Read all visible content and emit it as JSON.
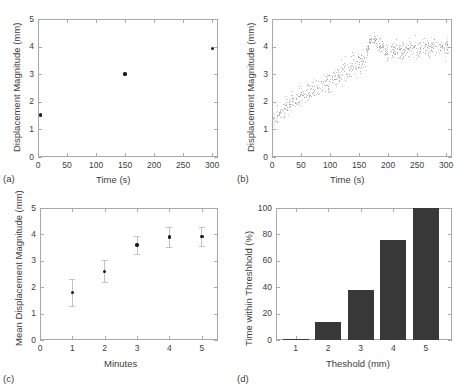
{
  "figure": {
    "width": 465,
    "height": 388,
    "background": "#ffffff",
    "axis_color": "#a9a9a9",
    "text_color": "#3d3d3d",
    "marker_color": "#1a1a1a",
    "scatter_color": "#8e8e8e",
    "errorbar_color": "#c2c2c2",
    "bar_color": "#383838"
  },
  "panels": [
    {
      "tag": "(a)",
      "chart_data": {
        "type": "scatter",
        "title": "",
        "xlabel": "Time (s)",
        "ylabel": "Displacement Magnitude (mm)",
        "xlim": [
          0,
          310
        ],
        "ylim": [
          0,
          5
        ],
        "xticks": [
          0,
          50,
          100,
          150,
          200,
          250,
          300
        ],
        "yticks": [
          0,
          1,
          2,
          3,
          4,
          5
        ],
        "grid": false,
        "legend": "none",
        "points": [
          {
            "x": 5,
            "y": 1.52
          },
          {
            "x": 150,
            "y": 3.01
          },
          {
            "x": 300,
            "y": 3.92
          }
        ]
      }
    },
    {
      "tag": "(b)",
      "chart_data": {
        "type": "scatter",
        "title": "",
        "xlabel": "Time (s)",
        "ylabel": "Displacement Magnitude (mm)",
        "xlim": [
          0,
          310
        ],
        "ylim": [
          0,
          5
        ],
        "xticks": [
          0,
          50,
          100,
          150,
          200,
          250,
          300
        ],
        "yticks": [
          0,
          1,
          2,
          3,
          4,
          5
        ],
        "grid": false,
        "legend": "none",
        "description": "Dense gray scatter of per-frame displacement; rises from about 1.2 mm at t=0 to about 3.5 mm at t=160, jumps to a cluster near 4.3 mm around t=170-180, then plateaus near 4.0 mm through t=300.",
        "trend_anchors": [
          {
            "x": 0,
            "y": 1.25,
            "spread": 0.35
          },
          {
            "x": 20,
            "y": 1.75,
            "spread": 0.35
          },
          {
            "x": 40,
            "y": 2.05,
            "spread": 0.35
          },
          {
            "x": 60,
            "y": 2.3,
            "spread": 0.38
          },
          {
            "x": 80,
            "y": 2.5,
            "spread": 0.38
          },
          {
            "x": 100,
            "y": 2.75,
            "spread": 0.4
          },
          {
            "x": 120,
            "y": 3.0,
            "spread": 0.4
          },
          {
            "x": 140,
            "y": 3.25,
            "spread": 0.4
          },
          {
            "x": 160,
            "y": 3.5,
            "spread": 0.42
          },
          {
            "x": 170,
            "y": 4.25,
            "spread": 0.18
          },
          {
            "x": 180,
            "y": 4.2,
            "spread": 0.25
          },
          {
            "x": 200,
            "y": 3.8,
            "spread": 0.35
          },
          {
            "x": 220,
            "y": 3.85,
            "spread": 0.35
          },
          {
            "x": 240,
            "y": 3.95,
            "spread": 0.35
          },
          {
            "x": 260,
            "y": 3.95,
            "spread": 0.35
          },
          {
            "x": 280,
            "y": 4.0,
            "spread": 0.35
          },
          {
            "x": 305,
            "y": 4.0,
            "spread": 0.35
          }
        ],
        "n_points": 760
      }
    },
    {
      "tag": "(c)",
      "chart_data": {
        "type": "scatter",
        "title": "",
        "xlabel": "Minutes",
        "ylabel": "Mean Displacement Magnitude (mm)",
        "xlim": [
          0,
          5.5
        ],
        "ylim": [
          0,
          5
        ],
        "xticks": [
          0,
          1,
          2,
          3,
          4,
          5
        ],
        "yticks": [
          0,
          1,
          2,
          3,
          4,
          5
        ],
        "grid": false,
        "legend": "none",
        "categories": [
          1,
          2,
          3,
          4,
          5
        ],
        "values": [
          1.8,
          2.6,
          3.6,
          3.9,
          3.92
        ],
        "errors": [
          0.5,
          0.42,
          0.35,
          0.38,
          0.35
        ]
      }
    },
    {
      "tag": "(d)",
      "chart_data": {
        "type": "bar",
        "title": "",
        "xlabel": "Theshold (mm)",
        "ylabel": "Time within Threshhold (%)",
        "xlim": [
          0.4,
          5.8
        ],
        "ylim": [
          0,
          100
        ],
        "xticks": [
          1,
          2,
          3,
          4,
          5
        ],
        "yticks": [
          0,
          20,
          40,
          60,
          80,
          100
        ],
        "grid": false,
        "legend": "none",
        "categories": [
          "1",
          "2",
          "3",
          "4",
          "5"
        ],
        "values": [
          1,
          14,
          38,
          76,
          100
        ]
      }
    }
  ]
}
